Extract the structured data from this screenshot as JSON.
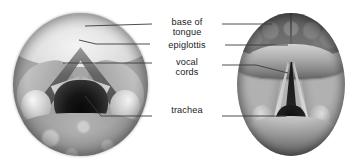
{
  "figure": {
    "panels": [
      {
        "id": "photograph",
        "name": "endoscopic-photograph",
        "side": "left",
        "description": "Grayscale laryngoscopic photograph of the larynx viewed from above"
      },
      {
        "id": "illustration",
        "name": "anatomical-illustration",
        "side": "right",
        "description": "Grayscale anatomical drawing of the same laryngoscopic view"
      }
    ],
    "labels": [
      {
        "key": "base_of_tongue",
        "text": "base of\ntongue"
      },
      {
        "key": "epiglottis",
        "text": "epiglottis"
      },
      {
        "key": "vocal_cords",
        "text": "vocal\ncords"
      },
      {
        "key": "trachea",
        "text": "trachea"
      }
    ],
    "colors": {
      "background": "#ffffff",
      "text": "#1b1b1b",
      "leader_line": "#3a3a3a"
    }
  }
}
